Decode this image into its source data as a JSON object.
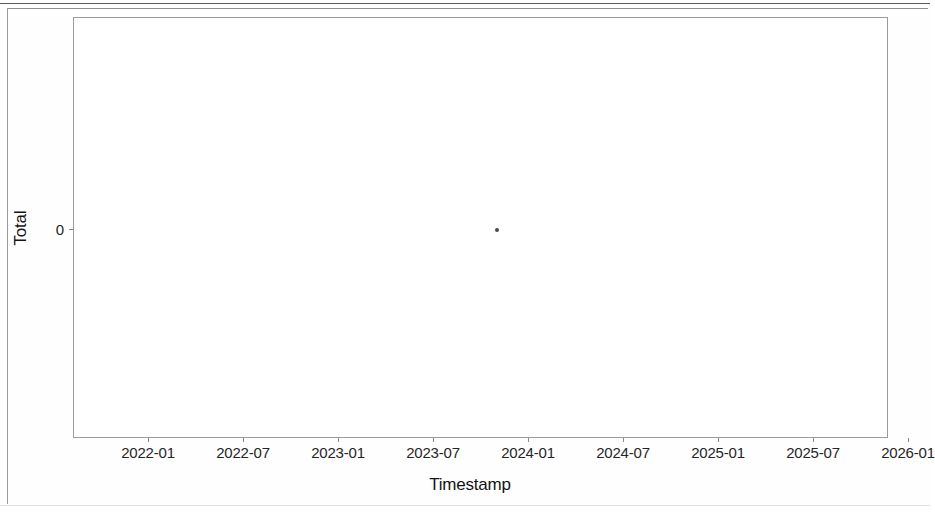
{
  "figure": {
    "background_color": "#ffffff",
    "frame_color": "#9b9b9b"
  },
  "chart_data": {
    "type": "scatter",
    "title": "",
    "xlabel": "Timestamp",
    "ylabel": "Total",
    "grid": false,
    "legend": null,
    "marker_color": "#4a4a4a",
    "xticklabels": [
      "2022-01",
      "2022-07",
      "2023-01",
      "2023-07",
      "2024-01",
      "2024-07",
      "2025-01",
      "2025-07",
      "2026-01"
    ],
    "yticklabels": [
      "0"
    ],
    "ytickvalues": [
      0
    ],
    "ylim": [
      -1,
      1
    ],
    "xlim": [
      "2021-09",
      "2026-02"
    ],
    "series": [
      {
        "name": "Total",
        "points": [
          {
            "x": "2023-11",
            "y": 0
          }
        ]
      }
    ]
  }
}
